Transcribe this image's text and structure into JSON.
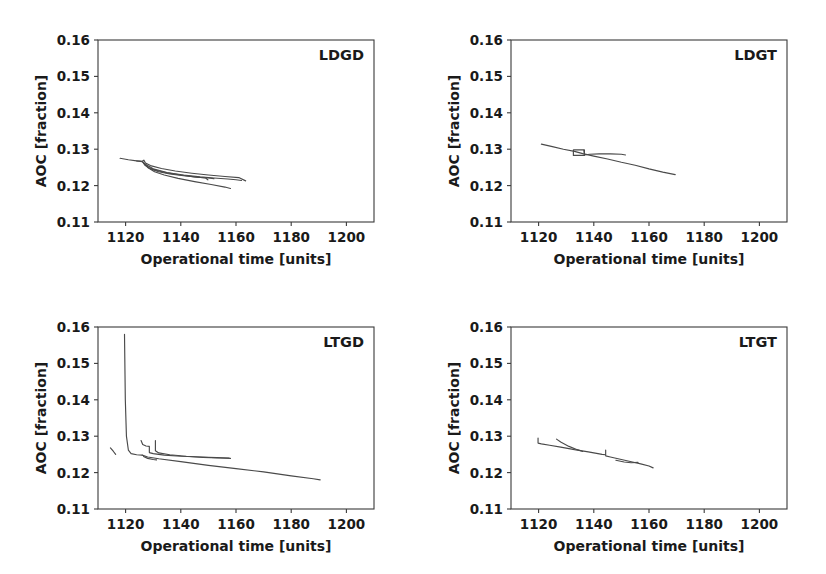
{
  "figure": {
    "width": 826,
    "height": 574,
    "background": "#ffffff",
    "line_color": "#4a4a4a",
    "axis_color": "#3a3a3a",
    "text_color": "#1a1a1a",
    "layout": "2x2 grid of line subplots"
  },
  "chart_data": [
    {
      "type": "line",
      "title": "LDGD",
      "panel": "top-left",
      "xlabel": "Operational time [units]",
      "ylabel": "AOC [fraction]",
      "xlim": [
        1110,
        1210
      ],
      "ylim": [
        0.11,
        0.16
      ],
      "xticks": [
        1120,
        1140,
        1160,
        1180,
        1200
      ],
      "xticklabels": [
        "1120",
        "1140",
        "1160",
        "1180",
        "1200"
      ],
      "yticks": [
        0.11,
        0.12,
        0.13,
        0.14,
        0.15,
        0.16
      ],
      "yticklabels": [
        "0.11",
        "0.12",
        "0.13",
        "0.14",
        "0.15",
        "0.16"
      ],
      "grid": false,
      "legend": "none",
      "series": [
        {
          "name": "run-1",
          "x": [
            1118.0,
            1121.0,
            1124.0,
            1126.0,
            1126.6,
            1127.2,
            1129.0,
            1133.0,
            1138.0,
            1144.0,
            1150.0,
            1156.0,
            1161.0,
            1163.5
          ],
          "y": [
            0.1275,
            0.1271,
            0.1268,
            0.1267,
            0.127,
            0.1262,
            0.1255,
            0.1247,
            0.124,
            0.1234,
            0.1229,
            0.1225,
            0.1222,
            0.1213
          ]
        },
        {
          "name": "run-2",
          "x": [
            1124.0,
            1126.0,
            1127.0,
            1128.5,
            1131.0,
            1135.0,
            1140.0,
            1145.0,
            1149.0,
            1149.8
          ],
          "y": [
            0.1268,
            0.1266,
            0.1258,
            0.1249,
            0.1242,
            0.1235,
            0.1229,
            0.1224,
            0.1221,
            0.1216
          ]
        },
        {
          "name": "run-3",
          "x": [
            1126.2,
            1127.0,
            1129.0,
            1132.0,
            1136.0,
            1141.0,
            1146.0,
            1150.0,
            1152.0
          ],
          "y": [
            0.1266,
            0.1256,
            0.1246,
            0.1238,
            0.1232,
            0.1227,
            0.1223,
            0.1221,
            0.1219
          ]
        },
        {
          "name": "run-4",
          "x": [
            1126.5,
            1128.0,
            1130.5,
            1134.0,
            1139.0,
            1145.0,
            1151.0,
            1156.0,
            1158.0
          ],
          "y": [
            0.1263,
            0.125,
            0.1238,
            0.1229,
            0.122,
            0.1211,
            0.1203,
            0.1196,
            0.1192
          ]
        },
        {
          "name": "run-5",
          "x": [
            1127.0,
            1130.0,
            1135.0,
            1141.0,
            1147.0,
            1152.0,
            1157.0,
            1160.0,
            1162.0
          ],
          "y": [
            0.1259,
            0.1246,
            0.1236,
            0.1229,
            0.1224,
            0.1221,
            0.1218,
            0.1216,
            0.1214
          ]
        }
      ]
    },
    {
      "type": "line",
      "title": "LDGT",
      "panel": "top-right",
      "xlabel": "Operational time [units]",
      "ylabel": "AOC [fraction]",
      "xlim": [
        1110,
        1210
      ],
      "ylim": [
        0.11,
        0.16
      ],
      "xticks": [
        1120,
        1140,
        1160,
        1180,
        1200
      ],
      "xticklabels": [
        "1120",
        "1140",
        "1160",
        "1180",
        "1200"
      ],
      "yticks": [
        0.11,
        0.12,
        0.13,
        0.14,
        0.15,
        0.16
      ],
      "yticklabels": [
        "0.11",
        "0.12",
        "0.13",
        "0.14",
        "0.15",
        "0.16"
      ],
      "grid": false,
      "legend": "none",
      "series": [
        {
          "name": "run-1",
          "x": [
            1121.0,
            1125.0,
            1129.0,
            1133.0,
            1136.0,
            1140.0,
            1145.0,
            1150.0,
            1155.0,
            1160.0,
            1165.0,
            1169.5
          ],
          "y": [
            0.1314,
            0.1307,
            0.13,
            0.1294,
            0.1288,
            0.1281,
            0.1273,
            0.1264,
            0.1256,
            0.1246,
            0.1237,
            0.123
          ]
        },
        {
          "name": "run-2",
          "x": [
            1132.6,
            1132.6,
            1136.6,
            1136.6,
            1132.8
          ],
          "y": [
            0.1298,
            0.1283,
            0.1283,
            0.1298,
            0.1298
          ]
        },
        {
          "name": "run-3",
          "x": [
            1136.4,
            1136.6,
            1138.5,
            1142.0,
            1146.0,
            1150.0,
            1151.5
          ],
          "y": [
            0.1297,
            0.1284,
            0.1286,
            0.1287,
            0.1287,
            0.1286,
            0.1284
          ]
        }
      ]
    },
    {
      "type": "line",
      "title": "LTGD",
      "panel": "bottom-left",
      "xlabel": "Operational time [units]",
      "ylabel": "AOC [fraction]",
      "xlim": [
        1110,
        1210
      ],
      "ylim": [
        0.11,
        0.16
      ],
      "xticks": [
        1120,
        1140,
        1160,
        1180,
        1200
      ],
      "xticklabels": [
        "1120",
        "1140",
        "1160",
        "1180",
        "1200"
      ],
      "yticks": [
        0.11,
        0.12,
        0.13,
        0.14,
        0.15,
        0.16
      ],
      "yticklabels": [
        "0.11",
        "0.12",
        "0.13",
        "0.14",
        "0.15",
        "0.16"
      ],
      "grid": false,
      "legend": "none",
      "series": [
        {
          "name": "spike-run",
          "x": [
            1119.6,
            1119.9,
            1120.3,
            1121.0,
            1122.0,
            1124.0,
            1126.0
          ],
          "y": [
            0.158,
            0.14,
            0.13,
            0.1262,
            0.1252,
            0.1249,
            0.1248
          ]
        },
        {
          "name": "short-left-segment",
          "x": [
            1114.5,
            1115.6,
            1116.4
          ],
          "y": [
            0.1268,
            0.1258,
            0.125
          ]
        },
        {
          "name": "lower-long-tail",
          "x": [
            1126.0,
            1128.0,
            1132.0,
            1140.0,
            1150.0,
            1160.0,
            1170.0,
            1180.0,
            1188.0,
            1190.5
          ],
          "y": [
            0.1248,
            0.1243,
            0.1238,
            0.123,
            0.122,
            0.1211,
            0.1202,
            0.1191,
            0.1183,
            0.118
          ]
        },
        {
          "name": "step-run-a",
          "x": [
            1125.6,
            1126.2,
            1127.4,
            1128.6,
            1128.6,
            1130.0,
            1134.0,
            1140.0,
            1147.0,
            1153.0,
            1157.5
          ],
          "y": [
            0.1288,
            0.1277,
            0.1273,
            0.1272,
            0.1255,
            0.1252,
            0.1248,
            0.1245,
            0.1243,
            0.1241,
            0.124
          ]
        },
        {
          "name": "step-run-b",
          "x": [
            1130.8,
            1130.8,
            1132.0,
            1136.0,
            1142.0,
            1148.0,
            1154.0,
            1158.0
          ],
          "y": [
            0.1288,
            0.126,
            0.1254,
            0.1249,
            0.1245,
            0.1242,
            0.124,
            0.1239
          ]
        },
        {
          "name": "lower-short-hook",
          "x": [
            1126.5,
            1128.0,
            1130.0,
            1131.2
          ],
          "y": [
            0.1244,
            0.1239,
            0.1236,
            0.1235
          ]
        }
      ]
    },
    {
      "type": "line",
      "title": "LTGT",
      "panel": "bottom-right",
      "xlabel": "Operational time [units]",
      "ylabel": "AOC [fraction]",
      "xlim": [
        1110,
        1210
      ],
      "ylim": [
        0.11,
        0.16
      ],
      "xticks": [
        1120,
        1140,
        1160,
        1180,
        1200
      ],
      "xticklabels": [
        "1120",
        "1140",
        "1160",
        "1180",
        "1200"
      ],
      "yticks": [
        0.11,
        0.12,
        0.13,
        0.14,
        0.15,
        0.16
      ],
      "yticklabels": [
        "0.11",
        "0.12",
        "0.13",
        "0.14",
        "0.15",
        "0.16"
      ],
      "grid": false,
      "legend": "none",
      "series": [
        {
          "name": "run-1",
          "x": [
            1119.8,
            1119.8,
            1121.0,
            1124.0,
            1128.0,
            1133.0,
            1138.0,
            1143.0,
            1144.2
          ],
          "y": [
            0.1295,
            0.1281,
            0.1279,
            0.1275,
            0.127,
            0.1263,
            0.1257,
            0.125,
            0.1249
          ]
        },
        {
          "name": "run-2",
          "x": [
            1126.5,
            1128.0,
            1131.0,
            1134.0,
            1136.0
          ],
          "y": [
            0.1292,
            0.1284,
            0.1272,
            0.1263,
            0.1258
          ]
        },
        {
          "name": "run-3",
          "x": [
            1144.3,
            1144.3,
            1146.0,
            1150.0,
            1154.0,
            1157.0,
            1160.0,
            1161.5
          ],
          "y": [
            0.1262,
            0.1246,
            0.1243,
            0.1236,
            0.1229,
            0.1224,
            0.1218,
            0.1213
          ]
        },
        {
          "name": "run-4",
          "x": [
            1148.0,
            1151.0,
            1153.5,
            1156.0
          ],
          "y": [
            0.1234,
            0.1229,
            0.1227,
            0.1228
          ]
        }
      ]
    }
  ]
}
